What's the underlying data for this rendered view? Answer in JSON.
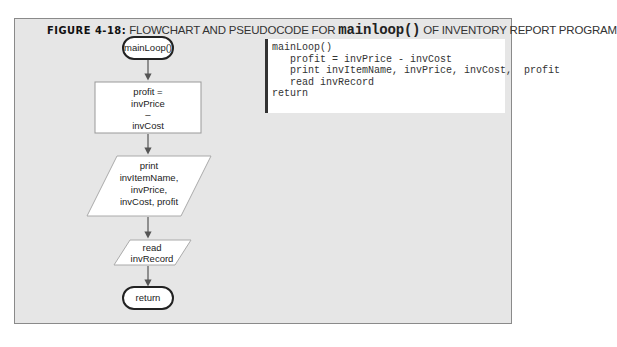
{
  "caption": {
    "figure_label": "FIGURE 4-18:",
    "prefix": "FLOWCHART AND PSEUDOCODE FOR",
    "code": "mainloop()",
    "suffix": "OF INVENTORY REPORT PROGRAM"
  },
  "flowchart": {
    "start": "mainLoop()",
    "process": [
      "profit =",
      "invPrice",
      "–",
      "invCost"
    ],
    "output": [
      "print",
      "invItemName,",
      "invPrice,",
      "invCost, profit"
    ],
    "input": [
      "read",
      "invRecord"
    ],
    "end": "return"
  },
  "pseudocode": {
    "lines": [
      "mainLoop()",
      "   profit = invPrice - invCost",
      "   print invItemName, invPrice, invCost,  profit",
      "   read invRecord",
      "return"
    ]
  }
}
